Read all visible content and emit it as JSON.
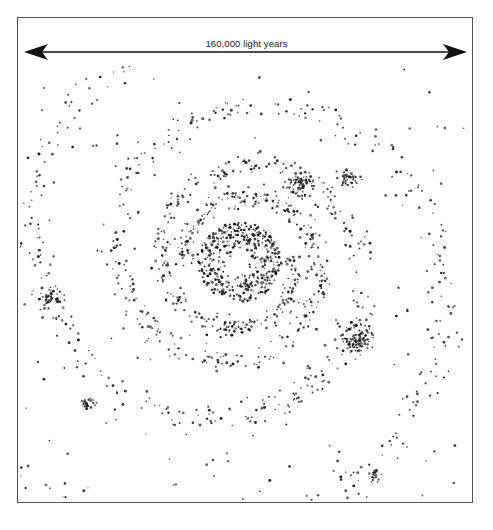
{
  "figure": {
    "scale_label": "160,000 light years",
    "scale_bar": {
      "x1": 24,
      "x2": 467,
      "y": 52,
      "color": "#111111"
    },
    "frame": {
      "x": 17,
      "y": 17,
      "width": 456,
      "height": 486,
      "stroke": "#555555"
    },
    "galaxy": {
      "center": [
        240,
        262
      ],
      "star_color": "#1a1a1a",
      "core": {
        "radius_inner": 10,
        "radius_outer": 42,
        "count": 420
      },
      "arms": [
        {
          "name": "arm-1",
          "start_angle": 0.0,
          "count": 620
        },
        {
          "name": "arm-2",
          "start_angle": 3.14,
          "count": 620
        }
      ],
      "spiral": {
        "a": 26,
        "b": 0.2,
        "turns": 2.1,
        "spread": 9
      },
      "clusters": [
        {
          "label": "left-knot",
          "x": 50,
          "y": 297,
          "r": 8,
          "count": 35
        },
        {
          "label": "right-knot",
          "x": 356,
          "y": 340,
          "r": 14,
          "count": 90
        },
        {
          "label": "upper-right-knot",
          "x": 300,
          "y": 185,
          "r": 14,
          "count": 70
        },
        {
          "label": "upper-far-knot",
          "x": 348,
          "y": 178,
          "r": 10,
          "count": 40
        },
        {
          "label": "lower-left-knot",
          "x": 88,
          "y": 405,
          "r": 8,
          "count": 25
        },
        {
          "label": "lower-right-knot",
          "x": 375,
          "y": 477,
          "r": 7,
          "count": 18
        }
      ],
      "field_stars": 160,
      "seed": 7
    }
  }
}
